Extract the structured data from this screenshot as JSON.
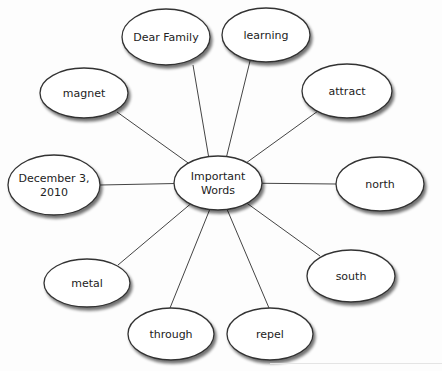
{
  "diagram": {
    "type": "word-web",
    "center": {
      "id": "center",
      "lines": [
        "Important",
        "Words"
      ],
      "cx": 218,
      "cy": 183,
      "rx": 44,
      "ry": 27
    },
    "nodes": [
      {
        "id": "dear-family",
        "lines": [
          "Dear Family"
        ],
        "cx": 166,
        "cy": 37,
        "rx": 44,
        "ry": 28,
        "edge": [
          193,
          65
        ]
      },
      {
        "id": "learning",
        "lines": [
          "learning"
        ],
        "cx": 266,
        "cy": 35,
        "rx": 44,
        "ry": 27,
        "edge": [
          250,
          61
        ]
      },
      {
        "id": "magnet",
        "lines": [
          "magnet"
        ],
        "cx": 84,
        "cy": 93,
        "rx": 44,
        "ry": 25,
        "edge": [
          117,
          112
        ]
      },
      {
        "id": "attract",
        "lines": [
          "attract"
        ],
        "cx": 347,
        "cy": 91,
        "rx": 45,
        "ry": 27,
        "edge": [
          318,
          111
        ]
      },
      {
        "id": "december",
        "lines": [
          "December 3,",
          "2010"
        ],
        "cx": 54,
        "cy": 185,
        "rx": 46,
        "ry": 30,
        "edge": [
          100,
          185
        ]
      },
      {
        "id": "north",
        "lines": [
          "north"
        ],
        "cx": 380,
        "cy": 184,
        "rx": 44,
        "ry": 27,
        "edge": [
          336,
          184
        ]
      },
      {
        "id": "metal",
        "lines": [
          "metal"
        ],
        "cx": 87,
        "cy": 283,
        "rx": 43,
        "ry": 24,
        "edge": [
          118,
          265
        ]
      },
      {
        "id": "south",
        "lines": [
          "south"
        ],
        "cx": 351,
        "cy": 276,
        "rx": 44,
        "ry": 26,
        "edge": [
          320,
          256
        ]
      },
      {
        "id": "through",
        "lines": [
          "through"
        ],
        "cx": 171,
        "cy": 334,
        "rx": 43,
        "ry": 26,
        "edge": [
          170,
          308
        ]
      },
      {
        "id": "repel",
        "lines": [
          "repel"
        ],
        "cx": 270,
        "cy": 334,
        "rx": 43,
        "ry": 26,
        "edge": [
          269,
          308
        ]
      }
    ],
    "colors": {
      "stroke": "#333333",
      "fill": "#ffffff",
      "shadow": "#9a9a9a",
      "line": "#444444"
    }
  }
}
